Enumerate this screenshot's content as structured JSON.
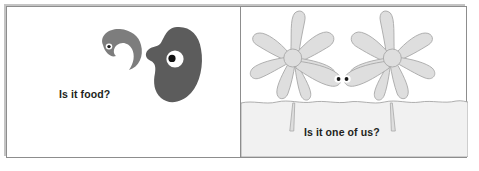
{
  "figure": {
    "type": "two-panel-cartoon-illustration",
    "width": 479,
    "height": 171,
    "background_color": "#ffffff",
    "frame_border_color": "#8d8d8d",
    "divider_color": "#8d8d8d"
  },
  "panels": [
    {
      "id": "panel-left",
      "caption": "Is it food?",
      "caption_color": "#231f20",
      "background_color": "#ffffff",
      "creatures": [
        {
          "name": "small-comma-creature",
          "description": "small comma / tadpole shaped organism with one eye, facing right",
          "fill_color": "#7d7d7d",
          "eye_sclera_color": "#ffffff",
          "eye_pupil_color": "#1a1a1a"
        },
        {
          "name": "large-blob-creature",
          "description": "large dark kidney-bean shaped organism with one large eye",
          "fill_color": "#5c5c5c",
          "eye_sclera_color": "#ffffff",
          "eye_pupil_color": "#111111"
        }
      ]
    },
    {
      "id": "panel-right",
      "caption": "Is it one of us?",
      "caption_color": "#231f20",
      "background_color": "#ffffff",
      "ground_fill_color": "#f1f1f1",
      "ground_line_color": "#9a9a9a",
      "creatures": [
        {
          "name": "amoeba-creature-left",
          "description": "pale branching star / sponge shaped organism on a stalk, eye on right-facing lobe",
          "fill_color": "#dedede",
          "outline_color": "#a8a8a8",
          "eye_sclera_color": "#ffffff",
          "eye_pupil_color": "#1a1a1a"
        },
        {
          "name": "amoeba-creature-right",
          "description": "mirrored pale branching star / sponge shaped organism on a stalk, eye on left-facing lobe",
          "fill_color": "#dedede",
          "outline_color": "#a8a8a8",
          "eye_sclera_color": "#ffffff",
          "eye_pupil_color": "#1a1a1a"
        }
      ]
    }
  ]
}
